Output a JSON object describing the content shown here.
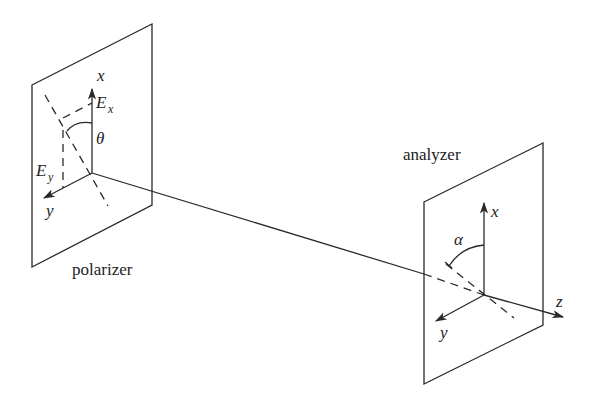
{
  "diagram": {
    "type": "optics-polarization-setup",
    "polarizer": {
      "label": "polarizer",
      "axis_x": "x",
      "axis_y": "y",
      "field_x": "E",
      "field_x_sub": "x",
      "field_y": "E",
      "field_y_sub": "y",
      "angle": "θ"
    },
    "analyzer": {
      "label": "analyzer",
      "axis_x": "x",
      "axis_y": "y",
      "axis_z": "z",
      "angle": "α"
    },
    "colors": {
      "stroke": "#2a2a2a",
      "background": "#ffffff"
    }
  }
}
